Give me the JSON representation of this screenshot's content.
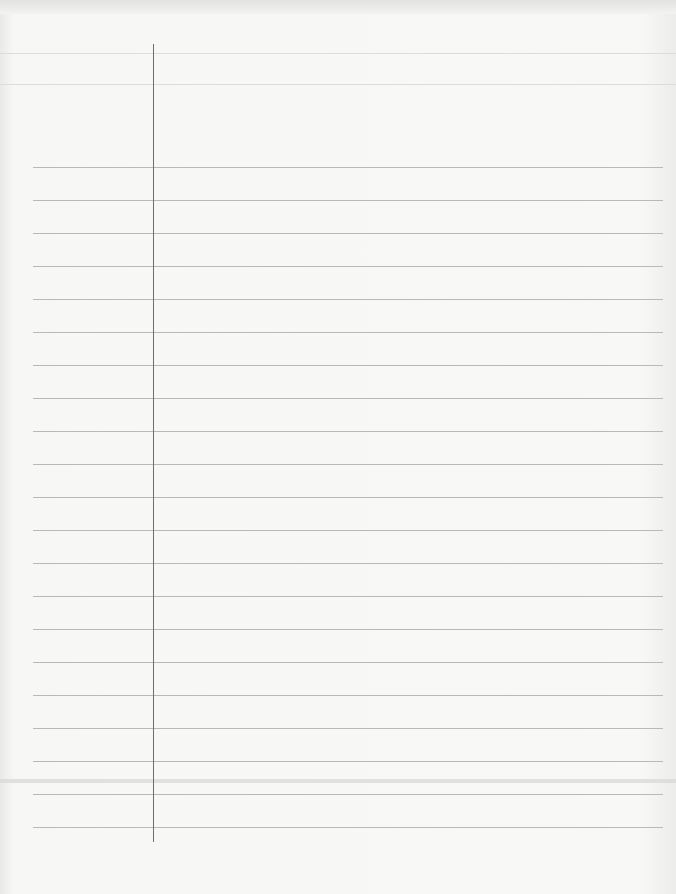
{
  "sheet": {
    "type": "blank ruled notebook page",
    "background_color": "#f6f6f5",
    "rule_color": "#b9b9b9",
    "margin_color": "#6e6e6e"
  },
  "margin_line": {
    "x": 153,
    "top": 44,
    "bottom": 842
  },
  "faint_lines": [
    53,
    84
  ],
  "scan_bands": [
    781
  ],
  "rules": {
    "left": 33,
    "right": 663,
    "positions": [
      167,
      200,
      233,
      266,
      299,
      332,
      365,
      398,
      431,
      464,
      497,
      530,
      563,
      596,
      629,
      662,
      695,
      728,
      761,
      794,
      827
    ]
  }
}
